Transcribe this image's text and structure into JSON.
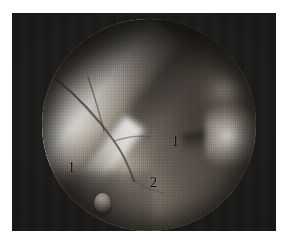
{
  "figure": {
    "type": "endoscopic-photograph",
    "frame": {
      "background_color": "#ffffff",
      "plate_color": "#1b1a19"
    },
    "scope": {
      "shape": "circle",
      "field_color": "#8d8478"
    },
    "structures": [
      {
        "name": "soft-tissue-left",
        "label": "1"
      },
      {
        "name": "soft-tissue-right",
        "label": "1"
      },
      {
        "name": "fibrous-band",
        "label": "2"
      }
    ],
    "annotations": [
      {
        "id": "label-1-left",
        "text": "1",
        "x": 68,
        "y": 161
      },
      {
        "id": "label-1-right",
        "text": "1",
        "x": 172,
        "y": 135
      },
      {
        "id": "label-2",
        "text": "2",
        "x": 150,
        "y": 176
      }
    ]
  }
}
